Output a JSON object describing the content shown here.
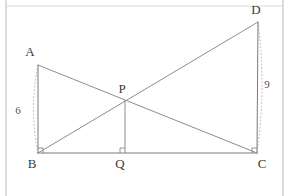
{
  "figure": {
    "background_color": "#ffffff",
    "line_color": "#7a7a80",
    "dash_color": "#a9a9b0",
    "label_color": "#3a3a3a",
    "frame_color": "#b9b9bd"
  },
  "points": {
    "A": {
      "label": "A",
      "x": 38,
      "y": 65,
      "label_x": 30,
      "label_y": 56
    },
    "B": {
      "label": "B",
      "x": 38,
      "y": 153,
      "label_x": 32,
      "label_y": 168
    },
    "C": {
      "label": "C",
      "x": 257,
      "y": 153,
      "label_x": 262,
      "label_y": 168
    },
    "D": {
      "label": "D",
      "x": 258,
      "y": 22,
      "label_x": 256,
      "label_y": 14
    },
    "P": {
      "label": "P",
      "x": 125,
      "y": 100,
      "label_x": 122,
      "label_y": 93
    },
    "Q": {
      "label": "Q",
      "x": 125,
      "y": 153,
      "label_x": 120,
      "label_y": 168
    }
  },
  "segments": [
    {
      "name": "segment-ab",
      "from": "A",
      "to": "B"
    },
    {
      "name": "segment-bc",
      "from": "B",
      "to": "C"
    },
    {
      "name": "segment-dc",
      "from": "D",
      "to": "C"
    },
    {
      "name": "segment-ac",
      "from": "A",
      "to": "C"
    },
    {
      "name": "segment-bd",
      "from": "B",
      "to": "D"
    },
    {
      "name": "segment-pq",
      "from": "P",
      "to": "Q"
    }
  ],
  "measures": [
    {
      "name": "measure-ab",
      "label": "6",
      "label_x": 18,
      "label_y": 114,
      "side": "left",
      "from": "A",
      "to": "B"
    },
    {
      "name": "measure-dc",
      "label": "9",
      "label_x": 267,
      "label_y": 88,
      "side": "right",
      "from": "D",
      "to": "C"
    }
  ],
  "right_angles": [
    {
      "name": "right-angle-b",
      "at": "B",
      "x": 38,
      "y": 153
    },
    {
      "name": "right-angle-q",
      "at": "Q",
      "x": 125,
      "y": 153
    },
    {
      "name": "right-angle-c",
      "at": "C",
      "x": 257,
      "y": 153
    }
  ],
  "frame": {
    "left_x": 6,
    "right_x": 283,
    "top_y": 6,
    "bottom_y": 196
  }
}
